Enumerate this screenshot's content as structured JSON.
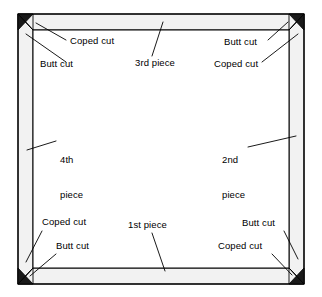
{
  "diagram": {
    "kind": "line-drawing",
    "background_color": "#ffffff",
    "line_color": "#000000",
    "molding_fill_color": "#f2f2f2",
    "corner_block_color": "#1a1a1a",
    "frame": {
      "outer_rect": {
        "x": 18,
        "y": 14,
        "width": 286,
        "height": 270
      },
      "inner_rect": {
        "x": 33,
        "y": 30,
        "width": 256,
        "height": 238
      },
      "description": "Room perimeter seen in plan view; four molding runs form a rectangle with mitred-looking corner joints."
    },
    "pieces": [
      {
        "id": "piece-1",
        "label": "1st piece",
        "position": "bottom",
        "label_x": 128,
        "label_y": 224
      },
      {
        "id": "piece-2",
        "label": "2nd piece",
        "line1": "2nd",
        "line2": "piece",
        "position": "right",
        "label_x": 222,
        "label_y": 135
      },
      {
        "id": "piece-3",
        "label": "3rd piece",
        "position": "top",
        "label_x": 135,
        "label_y": 62
      },
      {
        "id": "piece-4",
        "label": "4th piece",
        "line1": "4th",
        "line2": "piece",
        "position": "left",
        "label_x": 60,
        "label_y": 135
      }
    ],
    "cut_labels": [
      {
        "id": "coped-cut-top-left",
        "text": "Coped cut",
        "corner": "top-left",
        "x": 70,
        "y": 40
      },
      {
        "id": "butt-cut-top-left",
        "text": "Butt cut",
        "corner": "top-left",
        "x": 40,
        "y": 64
      },
      {
        "id": "butt-cut-top-right",
        "text": "Butt cut",
        "corner": "top-right",
        "x": 224,
        "y": 41
      },
      {
        "id": "coped-cut-top-right",
        "text": "Coped cut",
        "corner": "top-right",
        "x": 214,
        "y": 64
      },
      {
        "id": "coped-cut-bottom-left",
        "text": "Coped cut",
        "corner": "bottom-left",
        "x": 42,
        "y": 221
      },
      {
        "id": "butt-cut-bottom-left",
        "text": "Butt cut",
        "corner": "bottom-left",
        "x": 56,
        "y": 245
      },
      {
        "id": "butt-cut-bottom-right",
        "text": "Butt cut",
        "corner": "bottom-right",
        "x": 242,
        "y": 222
      },
      {
        "id": "coped-cut-bottom-right",
        "text": "Coped cut",
        "corner": "bottom-right",
        "x": 218,
        "y": 245
      }
    ]
  }
}
